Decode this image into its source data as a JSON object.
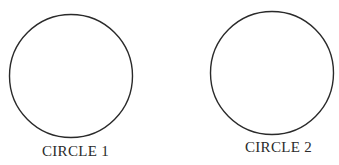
{
  "diagram": {
    "stroke_color": "#2a2a2a",
    "circles": [
      {
        "label": "CIRCLE 1",
        "cx": 71,
        "cy": 76,
        "r": 62
      },
      {
        "label": "CIRCLE 2",
        "cx": 272,
        "cy": 73,
        "r": 62
      }
    ]
  }
}
